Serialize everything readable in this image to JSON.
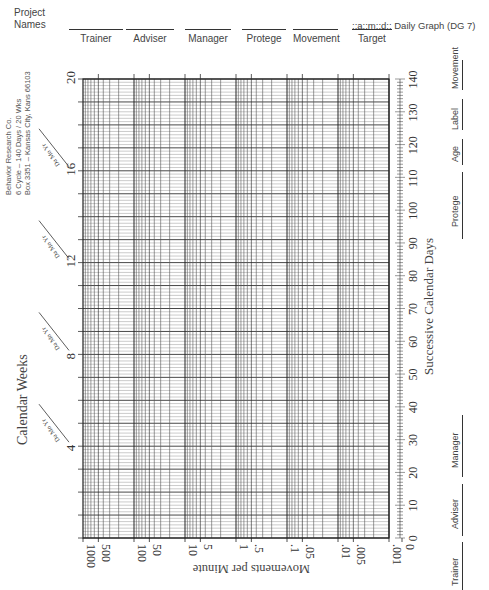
{
  "header": {
    "project_names_label": "Project\nNames",
    "project_name_line1": "Project",
    "project_name_line2": "Names",
    "slots": [
      "Trainer",
      "Adviser",
      "Manager",
      "Protege",
      "Movement",
      "Target"
    ],
    "title": "::a::m::d:: Daily Graph (DG 7)"
  },
  "publisher": {
    "line1": "Behavior Research Co.",
    "line2": "6 Cycle – 140 Days / 20 Wks",
    "line3": "Box 3351 – Kansas City, Kans 66103"
  },
  "left_axis": {
    "title": "Calendar Weeks",
    "week_labels": [
      "4",
      "8",
      "12",
      "16",
      "20"
    ],
    "date_stamp": "Da Mo Yr"
  },
  "bottom_axis": {
    "title": "Movements per Minute"
  },
  "right_axis": {
    "title": "Successive Calendar Days"
  },
  "right_slots": [
    "Trainer",
    "Adviser",
    "Manager",
    "Protege",
    "Age",
    "Label",
    "Movement"
  ],
  "chart_data": {
    "type": "line",
    "title": "Daily Graph (DG 7)",
    "subtitle": "6 Cycle – 140 Days / 20 Wks",
    "xlabel": "Successive Calendar Days",
    "ylabel": "Movements per Minute",
    "x_secondary_label": "Calendar Weeks",
    "x_range": [
      0,
      140
    ],
    "x_ticks": [
      0,
      10,
      20,
      30,
      40,
      50,
      60,
      70,
      80,
      90,
      100,
      110,
      120,
      130,
      140
    ],
    "x_secondary_ticks": [
      4,
      8,
      12,
      16,
      20
    ],
    "y_scale": "log",
    "y_range": [
      0.001,
      1000
    ],
    "y_ticks": [
      "1000",
      "500",
      "100",
      "50",
      "10",
      "5",
      "1",
      ".5",
      ".1",
      ".05",
      ".01",
      ".005",
      ".001",
      "0"
    ],
    "grid": true,
    "series": []
  }
}
